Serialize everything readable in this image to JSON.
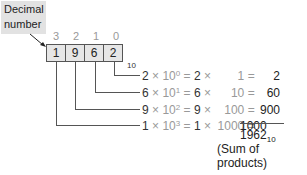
{
  "label": {
    "line1": "Decimal",
    "line2": "number"
  },
  "positions": [
    "3",
    "2",
    "1",
    "0"
  ],
  "digits": [
    "1",
    "9",
    "6",
    "2"
  ],
  "base_subscript": "10",
  "rows": [
    {
      "digit": "2",
      "power": "0",
      "digit2": "2",
      "weight": "1",
      "result": "2"
    },
    {
      "digit": "6",
      "power": "1",
      "digit2": "6",
      "weight": "10",
      "result": "60"
    },
    {
      "digit": "9",
      "power": "2",
      "digit2": "9",
      "weight": "100",
      "result": "900"
    },
    {
      "digit": "1",
      "power": "3",
      "digit2": "1",
      "weight": "1000",
      "result": "1000"
    }
  ],
  "sum": {
    "value": "1962",
    "subscript": "10",
    "caption": "(Sum of products)"
  },
  "symbols": {
    "times": "×",
    "ten": "10",
    "equals": "="
  }
}
